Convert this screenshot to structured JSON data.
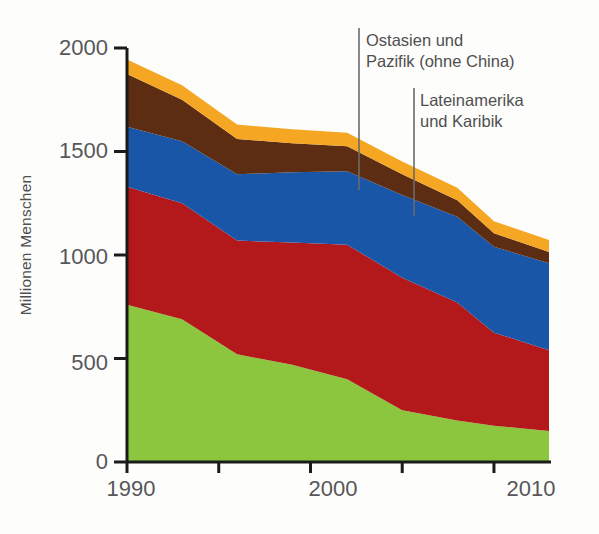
{
  "chart_data": {
    "type": "area",
    "title": "",
    "subtitle": "",
    "xlabel": "",
    "ylabel": "Millionen Menschen",
    "xlim": [
      1990,
      2013
    ],
    "ylim": [
      0,
      2000
    ],
    "grid": false,
    "legend_position": "inline-labels",
    "stacked": true,
    "x": [
      1990,
      1993,
      1996,
      1999,
      2002,
      2005,
      2008,
      2010,
      2013
    ],
    "xticks": [
      1990,
      1995,
      2000,
      2005,
      2010
    ],
    "xtick_labels": [
      "1990",
      "",
      "2000",
      "",
      "2010"
    ],
    "yticks": [
      0,
      500,
      1000,
      1500,
      2000
    ],
    "ytick_labels": [
      "0",
      "500",
      "1000",
      "1500",
      "2000"
    ],
    "series": [
      {
        "name": "China",
        "color": "#8CC63E",
        "label_color": "#ffffff",
        "values": [
          760,
          690,
          520,
          470,
          400,
          250,
          200,
          175,
          150
        ]
      },
      {
        "name": "Südasien",
        "color": "#B3191B",
        "label_color": "#ffffff",
        "values": [
          570,
          560,
          550,
          590,
          650,
          640,
          570,
          450,
          390
        ]
      },
      {
        "name": "Subsahara-Afrika",
        "color": "#1A56A8",
        "label_color": "#ffffff",
        "values": [
          290,
          300,
          320,
          340,
          355,
          400,
          415,
          415,
          420
        ]
      },
      {
        "name": "Ostasien und Pazifik (ohne China)",
        "color": "#5C2D12",
        "label_color": "#4f4f4f",
        "values": [
          255,
          200,
          170,
          140,
          120,
          100,
          80,
          65,
          55
        ]
      },
      {
        "name": "Lateinamerika und Karibik",
        "color": "#F5A game",
        "label_color": "#4f4f4f",
        "values": [
          70,
          70,
          70,
          68,
          65,
          62,
          60,
          58,
          57
        ]
      }
    ],
    "totals": [
      1945,
      1820,
      1630,
      1608,
      1590,
      1452,
      1325,
      1163,
      1072
    ],
    "annotations": [
      {
        "name": "Ostasien und Pazifik (ohne China)",
        "lines": [
          "Ostasien und",
          "Pazifik (ohne China)"
        ]
      },
      {
        "name": "Lateinamerika und Karibik",
        "lines": [
          "Lateinamerika",
          "und Karibik"
        ]
      }
    ],
    "inline_labels": [
      "Subsahara-Afrika",
      "Südasien",
      "China"
    ]
  },
  "colors": {
    "china": "#8CC63E",
    "suedasien": "#B3191B",
    "subsahara": "#1A56A8",
    "ostasien": "#5C2D12",
    "lateinamerika": "#F5A623",
    "axis": "#1b1b1b",
    "tick_text": "#57575a",
    "callout_text": "#4f4f4f",
    "background": "#fdfdfb"
  },
  "axis": {
    "y_title": "Millionen Menschen",
    "ytick_0": "0",
    "ytick_500": "500",
    "ytick_1000": "1000",
    "ytick_1500": "1500",
    "ytick_2000": "2000",
    "xtick_1990": "1990",
    "xtick_2000": "2000",
    "xtick_2010": "2010"
  },
  "labels": {
    "subsahara": "Subsahara-Afrika",
    "suedasien": "Südasien",
    "china": "China",
    "ostasien_line1": "Ostasien und",
    "ostasien_line2": "Pazifik (ohne China)",
    "latam_line1": "Lateinamerika",
    "latam_line2": "und Karibik"
  }
}
